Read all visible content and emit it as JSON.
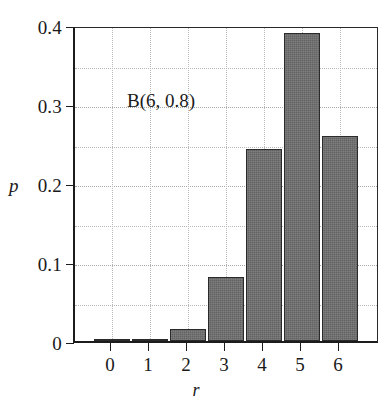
{
  "chart_data": {
    "type": "bar",
    "title": "",
    "annotation": "B(6, 0.8)",
    "xlabel": "r",
    "ylabel": "p",
    "categories": [
      "0",
      "1",
      "2",
      "3",
      "4",
      "5",
      "6"
    ],
    "values": [
      6.4e-05,
      0.001536,
      0.01536,
      0.08192,
      0.24576,
      0.39322,
      0.26214
    ],
    "ylim": [
      0,
      0.4
    ],
    "xlim": [
      -0.5,
      6.5
    ],
    "ytick_labels": [
      "0",
      "0.1",
      "0.2",
      "0.3",
      "0.4"
    ],
    "ytick_values": [
      0,
      0.1,
      0.2,
      0.3,
      0.4
    ],
    "xtick_labels": [
      "0",
      "1",
      "2",
      "3",
      "4",
      "5",
      "6"
    ],
    "minor_gridline_values": [
      0.05,
      0.15,
      0.25,
      0.35
    ],
    "grid": true,
    "legend": "none",
    "bar_fill_color": "#6f6f6f",
    "bar_edge_color": "#2b2b2b",
    "grid_color": "#b9b9b9",
    "axis_color": "#1c1c1c"
  }
}
